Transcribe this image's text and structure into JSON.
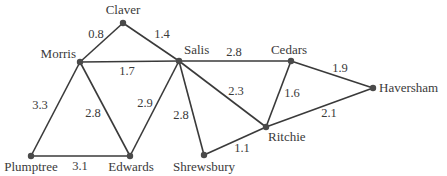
{
  "diagram": {
    "type": "weighted-graph",
    "nodes": [
      {
        "id": "claver",
        "label": "Claver",
        "x": 123,
        "y": 23,
        "lx": 123,
        "ly": 14,
        "anchor": "middle"
      },
      {
        "id": "morris",
        "label": "Morris",
        "x": 80,
        "y": 62,
        "lx": 76,
        "ly": 58,
        "anchor": "end"
      },
      {
        "id": "salis",
        "label": "Salis",
        "x": 179,
        "y": 61,
        "lx": 184,
        "ly": 54,
        "anchor": "start"
      },
      {
        "id": "cedars",
        "label": "Cedars",
        "x": 291,
        "y": 61,
        "lx": 289,
        "ly": 54,
        "anchor": "middle"
      },
      {
        "id": "haversham",
        "label": "Haversham",
        "x": 373,
        "y": 88,
        "lx": 379,
        "ly": 92,
        "anchor": "start"
      },
      {
        "id": "ritchie",
        "label": "Ritchie",
        "x": 266,
        "y": 127,
        "lx": 268,
        "ly": 141,
        "anchor": "start"
      },
      {
        "id": "shrewsbury",
        "label": "Shrewsbury",
        "x": 204,
        "y": 155,
        "lx": 204,
        "ly": 171,
        "anchor": "middle"
      },
      {
        "id": "edwards",
        "label": "Edwards",
        "x": 130,
        "y": 156,
        "lx": 131,
        "ly": 171,
        "anchor": "middle"
      },
      {
        "id": "plumptree",
        "label": "Plumptree",
        "x": 31,
        "y": 156,
        "lx": 31,
        "ly": 171,
        "anchor": "middle"
      }
    ],
    "edges": [
      {
        "from": "claver",
        "to": "morris",
        "weight": "0.8",
        "lx": 96,
        "ly": 38
      },
      {
        "from": "claver",
        "to": "salis",
        "weight": "1.4",
        "lx": 162,
        "ly": 38
      },
      {
        "from": "morris",
        "to": "salis",
        "weight": "1.7",
        "lx": 127,
        "ly": 75
      },
      {
        "from": "salis",
        "to": "cedars",
        "weight": "2.8",
        "lx": 234,
        "ly": 56
      },
      {
        "from": "cedars",
        "to": "haversham",
        "weight": "1.9",
        "lx": 340,
        "ly": 72
      },
      {
        "from": "salis",
        "to": "ritchie",
        "weight": "2.3",
        "lx": 236,
        "ly": 95
      },
      {
        "from": "cedars",
        "to": "ritchie",
        "weight": "1.6",
        "lx": 292,
        "ly": 97
      },
      {
        "from": "haversham",
        "to": "ritchie",
        "weight": "2.1",
        "lx": 329,
        "ly": 117
      },
      {
        "from": "salis",
        "to": "shrewsbury",
        "weight": "2.8",
        "lx": 181,
        "ly": 119
      },
      {
        "from": "salis",
        "to": "edwards",
        "weight": "2.9",
        "lx": 145,
        "ly": 107
      },
      {
        "from": "ritchie",
        "to": "shrewsbury",
        "weight": "1.1",
        "lx": 242,
        "ly": 152
      },
      {
        "from": "morris",
        "to": "plumptree",
        "weight": "3.3",
        "lx": 40,
        "ly": 109
      },
      {
        "from": "morris",
        "to": "edwards",
        "weight": "2.8",
        "lx": 93,
        "ly": 117
      },
      {
        "from": "plumptree",
        "to": "edwards",
        "weight": "3.1",
        "lx": 80,
        "ly": 170
      }
    ]
  }
}
